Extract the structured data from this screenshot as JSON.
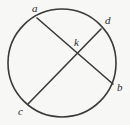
{
  "figure": {
    "type": "geometry-diagram",
    "width": 130,
    "height": 125,
    "background_color": "#f7f7f5",
    "stroke_color": "#3a3a3a",
    "label_color": "#2b2b2b"
  },
  "chart_data": {
    "type": "diagram",
    "title": "",
    "xlabel": "",
    "ylabel": "",
    "shapes": [
      {
        "kind": "circle",
        "name": "main-circle",
        "center": [
          62,
          63
        ],
        "radius": 54,
        "stroke": "#3a3a3a",
        "stroke_width": 1.6,
        "fill": "none"
      },
      {
        "kind": "chord",
        "name": "chord-ab",
        "from": "a",
        "to": "b",
        "x1": 37,
        "y1": 18,
        "x2": 113,
        "y2": 84,
        "stroke": "#3a3a3a",
        "stroke_width": 1.6
      },
      {
        "kind": "chord",
        "name": "chord-cd",
        "from": "c",
        "to": "d",
        "x1": 28,
        "y1": 104,
        "x2": 101,
        "y2": 29,
        "stroke": "#3a3a3a",
        "stroke_width": 1.6
      }
    ],
    "points": [
      {
        "id": "a",
        "label": "a",
        "x": 37,
        "y": 18,
        "on": "circle",
        "label_x": 32,
        "label_y": 3
      },
      {
        "id": "d",
        "label": "d",
        "x": 101,
        "y": 29,
        "on": "circle",
        "label_x": 105,
        "label_y": 15
      },
      {
        "id": "b",
        "label": "b",
        "x": 113,
        "y": 84,
        "on": "circle",
        "label_x": 117,
        "label_y": 82
      },
      {
        "id": "c",
        "label": "c",
        "x": 28,
        "y": 104,
        "on": "circle",
        "label_x": 18,
        "label_y": 106
      },
      {
        "id": "k",
        "label": "k",
        "x": 77,
        "y": 54,
        "on": "intersection",
        "label_x": 74,
        "label_y": 37
      }
    ],
    "legend": [],
    "annotations": []
  },
  "labels": {
    "a": "a",
    "b": "b",
    "c": "c",
    "d": "d",
    "k": "k"
  }
}
